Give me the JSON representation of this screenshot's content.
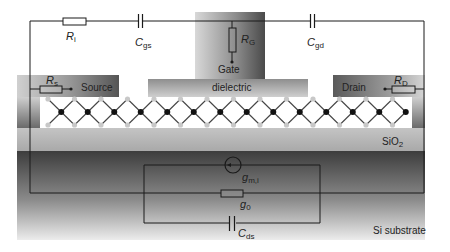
{
  "diagram": {
    "layers": {
      "source": "Source",
      "drain": "Drain",
      "gate": "Gate",
      "dielectric": "dielectric",
      "oxide": {
        "base": "SiO",
        "sub": "2"
      },
      "substrate": "Si substrate"
    },
    "components": {
      "Ri": {
        "sym": "R",
        "sub": "i"
      },
      "Cgs": {
        "sym": "C",
        "sub": "gs"
      },
      "RG": {
        "sym": "R",
        "sub": "G"
      },
      "Cgd": {
        "sym": "C",
        "sub": "gd"
      },
      "Rs": {
        "sym": "R",
        "sub": "s"
      },
      "RD": {
        "sym": "R",
        "sub": "D"
      },
      "gm": {
        "sym": "g",
        "sub": "m,i"
      },
      "g0": {
        "sym": "g",
        "sub": "0"
      },
      "Cds": {
        "sym": "C",
        "sub": "ds"
      }
    },
    "colors": {
      "wire": "#1a1a1a",
      "metal_dark": "#555555",
      "metal_light": "#cfcfcf",
      "oxide": "#b9b9b9",
      "substrate_top": "#3a3a3a",
      "substrate_bottom": "#e6e6e6",
      "atom_metal": "#111111",
      "atom_chalcogen": "#c8c8c8"
    }
  }
}
